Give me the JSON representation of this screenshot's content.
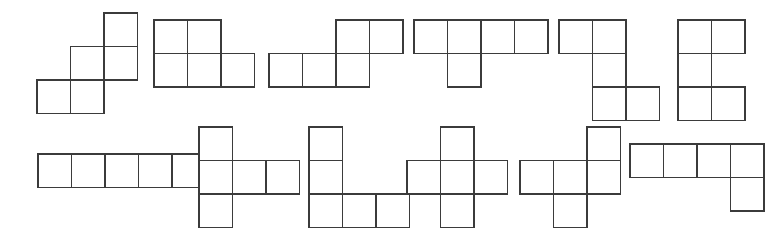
{
  "figure": {
    "width": 778,
    "height": 228,
    "background_color": "#ffffff",
    "stroke_color": "#3b3b3b",
    "fill_color": "#ffffff",
    "stroke_width": 1.6,
    "cell_size": 33.5,
    "shape_count": 12
  },
  "shapes": [
    {
      "id": "shape-1",
      "name": "W-pentomino",
      "row": 1,
      "index": 1,
      "x": 35,
      "y": 11,
      "cols": 3,
      "rows": 3,
      "cells": [
        [
          2,
          0
        ],
        [
          1,
          1
        ],
        [
          2,
          1
        ],
        [
          0,
          2
        ],
        [
          1,
          2
        ]
      ]
    },
    {
      "id": "shape-2",
      "name": "P-pentomino",
      "row": 1,
      "index": 2,
      "x": 152,
      "y": 18,
      "cols": 3,
      "rows": 2,
      "cells": [
        [
          0,
          0
        ],
        [
          1,
          0
        ],
        [
          0,
          1
        ],
        [
          1,
          1
        ],
        [
          2,
          1
        ]
      ]
    },
    {
      "id": "shape-3",
      "name": "N-pentomino",
      "row": 1,
      "index": 3,
      "x": 267,
      "y": 18,
      "cols": 4,
      "rows": 2,
      "cells": [
        [
          2,
          0
        ],
        [
          3,
          0
        ],
        [
          0,
          1
        ],
        [
          1,
          1
        ],
        [
          2,
          1
        ]
      ]
    },
    {
      "id": "shape-4",
      "name": "Y-pentomino",
      "row": 1,
      "index": 4,
      "x": 412,
      "y": 18,
      "cols": 4,
      "rows": 2,
      "cells": [
        [
          0,
          0
        ],
        [
          1,
          0
        ],
        [
          2,
          0
        ],
        [
          3,
          0
        ],
        [
          1,
          1
        ]
      ]
    },
    {
      "id": "shape-5",
      "name": "Z-pentomino",
      "row": 1,
      "index": 5,
      "x": 557,
      "y": 18,
      "cols": 3,
      "rows": 3,
      "cells": [
        [
          0,
          0
        ],
        [
          1,
          0
        ],
        [
          1,
          1
        ],
        [
          1,
          2
        ],
        [
          2,
          2
        ]
      ]
    },
    {
      "id": "shape-6",
      "name": "U-pentomino",
      "row": 1,
      "index": 6,
      "x": 676,
      "y": 18,
      "cols": 2,
      "rows": 3,
      "cells": [
        [
          0,
          0
        ],
        [
          1,
          0
        ],
        [
          0,
          1
        ],
        [
          0,
          2
        ],
        [
          1,
          2
        ]
      ]
    },
    {
      "id": "shape-7",
      "name": "I-pentomino",
      "row": 2,
      "index": 7,
      "x": 36,
      "y": 152,
      "cols": 5,
      "rows": 1,
      "cells": [
        [
          0,
          0
        ],
        [
          1,
          0
        ],
        [
          2,
          0
        ],
        [
          3,
          0
        ],
        [
          4,
          0
        ]
      ]
    },
    {
      "id": "shape-8",
      "name": "T-pentomino",
      "row": 2,
      "index": 8,
      "x": 197,
      "y": 125,
      "cols": 3,
      "rows": 3,
      "cells": [
        [
          0,
          0
        ],
        [
          0,
          1
        ],
        [
          1,
          1
        ],
        [
          2,
          1
        ],
        [
          0,
          2
        ]
      ]
    },
    {
      "id": "shape-9",
      "name": "V-pentomino",
      "row": 2,
      "index": 9,
      "x": 307,
      "y": 125,
      "cols": 3,
      "rows": 3,
      "cells": [
        [
          0,
          0
        ],
        [
          0,
          1
        ],
        [
          0,
          2
        ],
        [
          1,
          2
        ],
        [
          2,
          2
        ]
      ]
    },
    {
      "id": "shape-10",
      "name": "X-pentomino",
      "row": 2,
      "index": 10,
      "x": 405,
      "y": 125,
      "cols": 3,
      "rows": 3,
      "cells": [
        [
          1,
          0
        ],
        [
          0,
          1
        ],
        [
          1,
          1
        ],
        [
          2,
          1
        ],
        [
          1,
          2
        ]
      ]
    },
    {
      "id": "shape-11",
      "name": "F-pentomino",
      "row": 2,
      "index": 11,
      "x": 518,
      "y": 125,
      "cols": 3,
      "rows": 3,
      "cells": [
        [
          2,
          0
        ],
        [
          0,
          1
        ],
        [
          1,
          1
        ],
        [
          2,
          1
        ],
        [
          1,
          2
        ]
      ]
    },
    {
      "id": "shape-12",
      "name": "L-pentomino",
      "row": 2,
      "index": 12,
      "x": 628,
      "y": 142,
      "cols": 4,
      "rows": 2,
      "cells": [
        [
          0,
          0
        ],
        [
          1,
          0
        ],
        [
          2,
          0
        ],
        [
          3,
          0
        ],
        [
          3,
          1
        ]
      ]
    }
  ]
}
